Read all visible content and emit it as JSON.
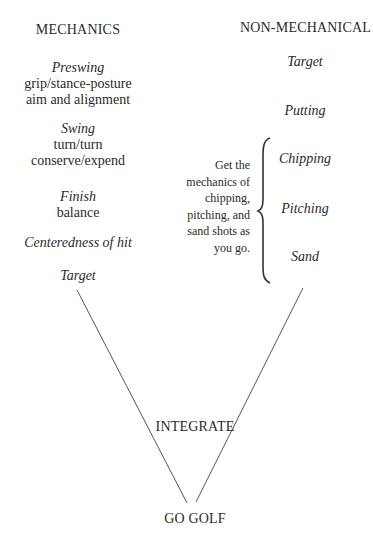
{
  "left_column": {
    "heading": "MECHANICS",
    "items": [
      {
        "title": "Preswing",
        "lines": [
          "grip/stance-posture",
          "aim and alignment"
        ]
      },
      {
        "title": "Swing",
        "lines": [
          "turn/turn",
          "conserve/expend"
        ]
      },
      {
        "title": "Finish",
        "lines": [
          "balance"
        ]
      },
      {
        "title": "Centeredness of hit",
        "lines": []
      },
      {
        "title": "Target",
        "lines": []
      }
    ]
  },
  "right_column": {
    "heading": "NON-MECHANICAL",
    "items": [
      "Target",
      "Putting",
      "Chipping",
      "Pitching",
      "Sand"
    ],
    "bracket_note": [
      "Get the",
      "mechanics of",
      "chipping,",
      "pitching, and",
      "sand shots as",
      "you go."
    ]
  },
  "convergence": {
    "label": "INTEGRATE",
    "result": "GO GOLF"
  }
}
